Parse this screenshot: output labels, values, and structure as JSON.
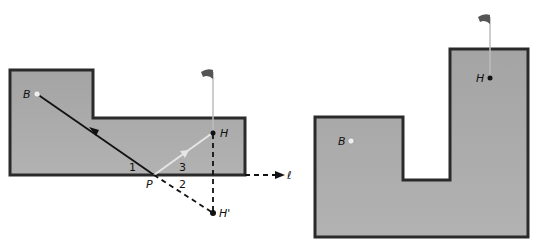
{
  "figure_left": {
    "title": "Reflection of hole across wall line",
    "labels": {
      "ball": "B",
      "hole": "H",
      "hole_reflection": "H'",
      "point": "P",
      "line": "ℓ",
      "angle1": "1",
      "angle2": "2",
      "angle3": "3"
    }
  },
  "figure_right": {
    "title": "L-shaped green",
    "labels": {
      "ball": "B",
      "hole": "H"
    }
  },
  "colors": {
    "green_fill": "#a8a8a8",
    "border": "#2a2a2a",
    "ball": "#eeeeee",
    "shot_path": "#111111",
    "reflected_path": "#e0e0e0",
    "flag": "#555555"
  }
}
